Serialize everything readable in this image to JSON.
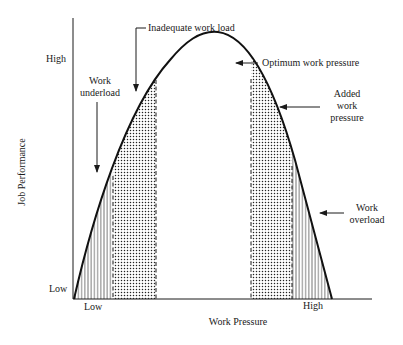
{
  "diagram": {
    "y_axis": {
      "title": "Job Performance",
      "high_label": "High",
      "low_label": "Low"
    },
    "x_axis": {
      "title": "Work Pressure",
      "low_label": "Low",
      "high_label": "High"
    },
    "annotations": {
      "inadequate_work_load": "Inadequate work load",
      "optimum_work_pressure": "Optimum work pressure",
      "work_underload_line1": "Work",
      "work_underload_line2": "underload",
      "added_work_pressure_line1": "Added",
      "added_work_pressure_line2": "work",
      "added_work_pressure_line3": "pressure",
      "work_overload_line1": "Work",
      "work_overload_line2": "overload"
    },
    "regions": [
      {
        "name": "work-underload",
        "pattern": "vertical-lines"
      },
      {
        "name": "inadequate-work-load",
        "pattern": "dots"
      },
      {
        "name": "optimum",
        "pattern": "none"
      },
      {
        "name": "added-work-pressure",
        "pattern": "dots"
      },
      {
        "name": "work-overload",
        "pattern": "vertical-lines"
      }
    ],
    "colors": {
      "ink": "#1a1a1a",
      "background": "#ffffff"
    }
  }
}
